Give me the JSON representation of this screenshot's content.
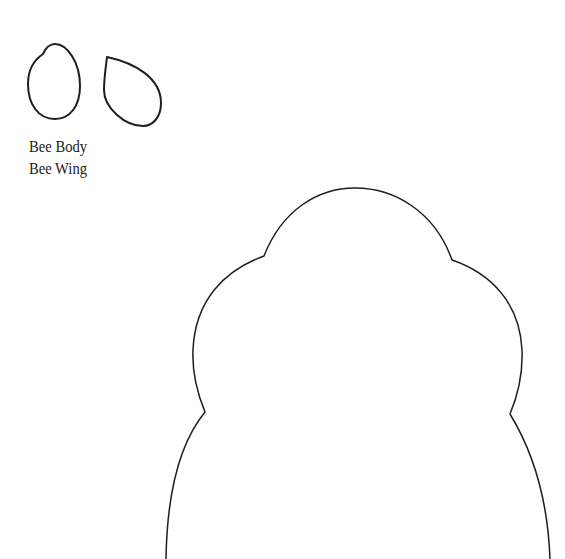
{
  "document": {
    "type": "printable template",
    "pieces": [
      {
        "id": "bee-body",
        "label": "Bee Body"
      },
      {
        "id": "bee-wing",
        "label": "Bee Wing"
      },
      {
        "id": "hive",
        "label": ""
      }
    ],
    "labels": [
      "Bee Body",
      "Bee Wing"
    ],
    "colors": {
      "outline": "#1e1e1e",
      "background": "#ffffff",
      "text": "#222222"
    }
  }
}
